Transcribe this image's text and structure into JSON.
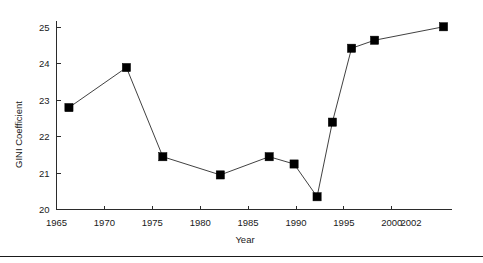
{
  "chart_data": {
    "type": "line",
    "title": "",
    "xlabel": "Year",
    "ylabel": "GINI Coefficient",
    "xlim": [
      1964.2,
      2006.5
    ],
    "ylim": [
      20,
      25.35
    ],
    "grid": false,
    "legend": null,
    "marker": "filled-square",
    "x_tick_labels": [
      "1965",
      "1970",
      "1975",
      "1980",
      "1985",
      "1990",
      "1995",
      "2000",
      "2002"
    ],
    "x_ticks": [
      1965,
      1970,
      1975,
      1980,
      1985,
      1990,
      1995,
      2000,
      2002
    ],
    "y_tick_labels": [
      "20",
      "21",
      "22",
      "23",
      "24",
      "25"
    ],
    "y_ticks": [
      20,
      21,
      22,
      23,
      24,
      25
    ],
    "series": [
      {
        "name": "GINI Coefficient",
        "x": [
          1966.3,
          1972.3,
          1976.1,
          1982.1,
          1987.2,
          1989.8,
          1992.2,
          1993.8,
          1995.8,
          1998.2,
          2005.4
        ],
        "values": [
          22.8,
          23.9,
          21.45,
          20.95,
          21.45,
          21.25,
          20.35,
          22.4,
          24.43,
          24.65,
          25.02
        ]
      }
    ]
  },
  "figure": {
    "y_axis_title": "GINI Coefficient",
    "x_axis_title": "Year"
  }
}
